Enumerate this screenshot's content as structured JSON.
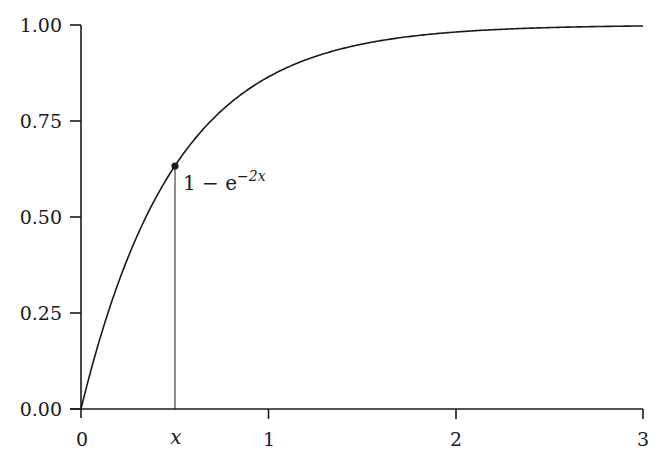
{
  "chart_data": {
    "type": "line",
    "title": "",
    "xlabel": "",
    "ylabel": "",
    "function": "1 - e^{-2x}",
    "xlim": [
      0,
      3
    ],
    "ylim": [
      0,
      1
    ],
    "grid": false,
    "legend": null,
    "x_ticks": [
      {
        "value": 0,
        "label": "0"
      },
      {
        "value": 0.5,
        "label": "x"
      },
      {
        "value": 1,
        "label": "1"
      },
      {
        "value": 2,
        "label": "2"
      },
      {
        "value": 3,
        "label": "3"
      }
    ],
    "y_ticks": [
      {
        "value": 0.0,
        "label": "0.00"
      },
      {
        "value": 0.25,
        "label": "0.25"
      },
      {
        "value": 0.5,
        "label": "0.50"
      },
      {
        "value": 0.75,
        "label": "0.75"
      },
      {
        "value": 1.0,
        "label": "1.00"
      }
    ],
    "series": [
      {
        "name": "1 - e^{-2x}",
        "x": [
          0,
          0.25,
          0.5,
          0.75,
          1.0,
          1.25,
          1.5,
          1.75,
          2.0,
          2.25,
          2.5,
          2.75,
          3.0
        ],
        "y": [
          0.0,
          0.393,
          0.632,
          0.777,
          0.865,
          0.918,
          0.95,
          0.97,
          0.982,
          0.989,
          0.993,
          0.996,
          0.998
        ]
      }
    ],
    "annotations": [
      {
        "type": "point",
        "x": 0.5,
        "y": 0.632,
        "label": "1 − e^{−2x}"
      },
      {
        "type": "vertical-line",
        "x": 0.5,
        "from_y": 0,
        "to_y": 0.632
      }
    ]
  },
  "labels": {
    "y": [
      "1.00",
      "0.75",
      "0.50",
      "0.25",
      "0.00"
    ],
    "x": [
      "0",
      "x",
      "1",
      "2",
      "3"
    ],
    "annotation_base": "1 − e",
    "annotation_exp": "−2x"
  }
}
